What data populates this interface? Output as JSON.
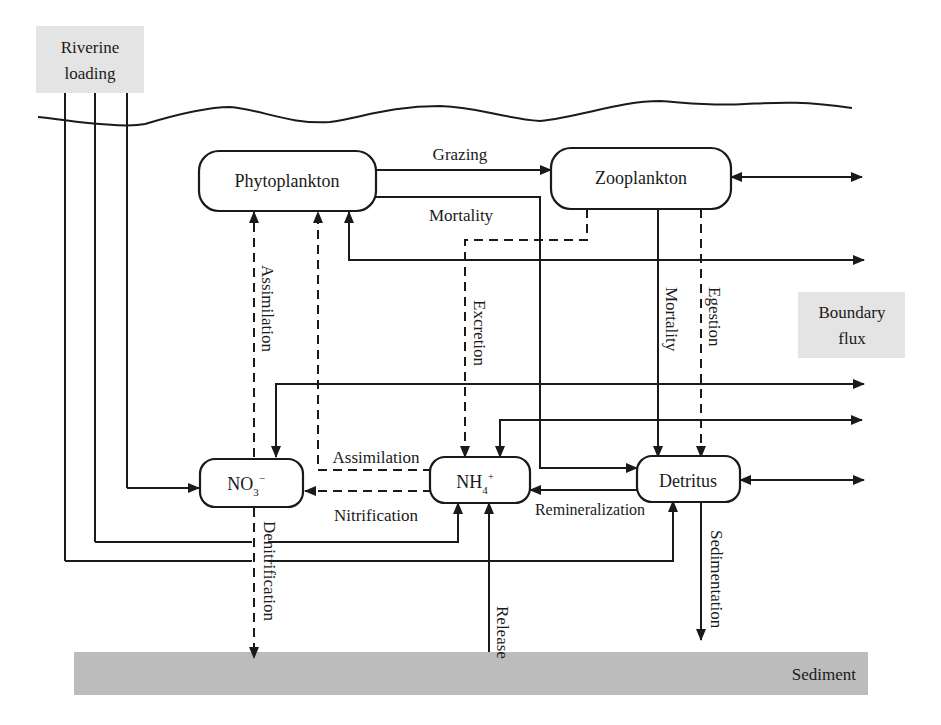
{
  "diagram": {
    "type": "nitrogen cycle model flow diagram",
    "external": {
      "riverine": [
        "Riverine",
        "loading"
      ],
      "boundary": [
        "Boundary",
        "flux"
      ],
      "sediment": "Sediment"
    },
    "nodes": {
      "phytoplankton": "Phytoplankton",
      "zooplankton": "Zooplankton",
      "no3": {
        "base": "NO",
        "sub": "3",
        "sup": "−"
      },
      "nh4": {
        "base": "NH",
        "sub": "4",
        "sup": "+"
      },
      "detritus": "Detritus"
    },
    "flows": {
      "grazing": "Grazing",
      "mortality_phyto": "Mortality",
      "assimilation_vertical": "Assimilation",
      "excretion": "Excretion",
      "mortality_zoo": "Mortality",
      "egestion": "Egestion",
      "assimilation_horizontal": "Assimilation",
      "nitrification": "Nitrification",
      "remineralization": "Remineralization",
      "denitrification": "Denitrification",
      "release": "Release",
      "sedimentation": "Sedimentation"
    },
    "edges": [
      {
        "from": "Phytoplankton",
        "to": "Zooplankton",
        "label": "Grazing",
        "style": "solid"
      },
      {
        "from": "Phytoplankton",
        "to": "Detritus",
        "label": "Mortality",
        "style": "solid"
      },
      {
        "from": "Zooplankton",
        "to": "Detritus",
        "label": "Mortality",
        "style": "solid"
      },
      {
        "from": "Zooplankton",
        "to": "Detritus",
        "label": "Egestion",
        "style": "dashed"
      },
      {
        "from": "Zooplankton",
        "to": "NH4+",
        "label": "Excretion",
        "style": "dashed"
      },
      {
        "from": "NO3-",
        "to": "Phytoplankton",
        "label": "Assimilation",
        "style": "dashed"
      },
      {
        "from": "NH4+",
        "to": "Phytoplankton",
        "label": "Assimilation",
        "style": "dashed"
      },
      {
        "from": "NH4+",
        "to": "NO3-",
        "label": "Nitrification",
        "style": "dashed"
      },
      {
        "from": "Detritus",
        "to": "NH4+",
        "label": "Remineralization",
        "style": "solid"
      },
      {
        "from": "NO3-",
        "to": "Sediment",
        "label": "Denitrification",
        "style": "dashed"
      },
      {
        "from": "Sediment",
        "to": "NH4+",
        "label": "Release",
        "style": "solid"
      },
      {
        "from": "Detritus",
        "to": "Sediment",
        "label": "Sedimentation",
        "style": "solid"
      },
      {
        "from": "Riverine loading",
        "to": "NO3-",
        "label": "",
        "style": "solid"
      },
      {
        "from": "Riverine loading",
        "to": "NH4+",
        "label": "",
        "style": "solid"
      },
      {
        "from": "Riverine loading",
        "to": "Detritus",
        "label": "",
        "style": "solid"
      },
      {
        "from": "Zooplankton",
        "to": "Boundary flux",
        "label": "",
        "style": "bidirectional"
      },
      {
        "from": "Detritus",
        "to": "Boundary flux",
        "label": "",
        "style": "bidirectional"
      },
      {
        "from": "Boundary flux",
        "to": "Phytoplankton",
        "label": "",
        "style": "bidirectional"
      },
      {
        "from": "Boundary flux",
        "to": "NO3-",
        "label": "",
        "style": "bidirectional"
      },
      {
        "from": "Boundary flux",
        "to": "NH4+",
        "label": "",
        "style": "bidirectional"
      }
    ]
  }
}
